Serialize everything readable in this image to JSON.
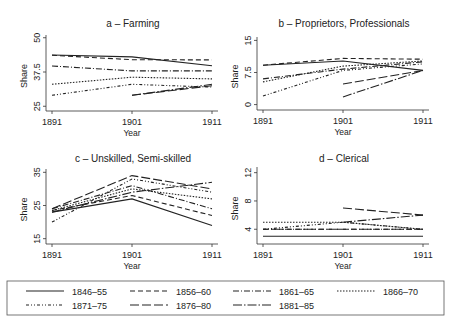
{
  "chart_data": [
    {
      "type": "line",
      "panel": "a",
      "title": "a – Farming",
      "xlabel": "Year",
      "ylabel": "Share",
      "x": [
        1891,
        1901,
        1911
      ],
      "xticks": [
        "1891",
        "1901",
        "1911"
      ],
      "yticks": [
        25,
        37.5,
        50
      ],
      "ytick_labels": [
        "25",
        "37.5",
        "50"
      ],
      "ylim": [
        24,
        51
      ],
      "grid": false,
      "series": [
        {
          "name": "1846–55",
          "values": [
            43.7,
            43.0,
            39.8
          ]
        },
        {
          "name": "1856–60",
          "values": [
            43.6,
            42.0,
            41.9
          ]
        },
        {
          "name": "1861–65",
          "values": [
            39.7,
            37.9,
            37.9
          ]
        },
        {
          "name": "1866–70",
          "values": [
            33.0,
            35.6,
            35.0
          ]
        },
        {
          "name": "1871–75",
          "values": [
            29.0,
            33.0,
            32.0
          ]
        },
        {
          "name": "1876–80",
          "values": [
            null,
            29.0,
            32.5
          ]
        },
        {
          "name": "1881–85",
          "values": [
            null,
            29.0,
            33.0
          ]
        }
      ]
    },
    {
      "type": "line",
      "panel": "b",
      "title": "b – Proprietors, Professionals",
      "xlabel": "Year",
      "ylabel": "Share",
      "x": [
        1891,
        1901,
        1911
      ],
      "xticks": [
        "1891",
        "1901",
        "1911"
      ],
      "yticks": [
        0,
        7.5,
        15
      ],
      "ytick_labels": [
        "0",
        "7.5",
        "15"
      ],
      "ylim": [
        -0.8,
        15.8
      ],
      "grid": false,
      "series": [
        {
          "name": "1846–55",
          "values": [
            9.2,
            10.2,
            8.0
          ]
        },
        {
          "name": "1856–60",
          "values": [
            9.2,
            10.8,
            10.6
          ]
        },
        {
          "name": "1861–65",
          "values": [
            6.0,
            8.3,
            10.0
          ]
        },
        {
          "name": "1866–70",
          "values": [
            5.3,
            9.0,
            10.2
          ]
        },
        {
          "name": "1871–75",
          "values": [
            2.0,
            8.0,
            9.5
          ]
        },
        {
          "name": "1876–80",
          "values": [
            null,
            4.8,
            8.0
          ]
        },
        {
          "name": "1881–85",
          "values": [
            null,
            1.8,
            8.0
          ]
        }
      ]
    },
    {
      "type": "line",
      "panel": "c",
      "title": "c – Unskilled, Semi-skilled",
      "xlabel": "Year",
      "ylabel": "Share",
      "x": [
        1891,
        1901,
        1911
      ],
      "xticks": [
        "1891",
        "1901",
        "1911"
      ],
      "yticks": [
        15,
        25,
        35
      ],
      "ytick_labels": [
        "15",
        "25",
        "35"
      ],
      "ylim": [
        14,
        36
      ],
      "grid": false,
      "series": [
        {
          "name": "1846–55",
          "values": [
            23.0,
            27.0,
            19.0
          ]
        },
        {
          "name": "1856–60",
          "values": [
            23.5,
            28.0,
            22.0
          ]
        },
        {
          "name": "1861–65",
          "values": [
            24.0,
            31.0,
            24.0
          ]
        },
        {
          "name": "1866–70",
          "values": [
            23.5,
            30.0,
            27.0
          ]
        },
        {
          "name": "1871–75",
          "values": [
            20.0,
            33.0,
            29.0
          ]
        },
        {
          "name": "1876–80",
          "values": [
            24.0,
            34.0,
            30.0
          ]
        },
        {
          "name": "1881–85",
          "values": [
            23.0,
            29.0,
            32.0
          ]
        }
      ]
    },
    {
      "type": "line",
      "panel": "d",
      "title": "d – Clerical",
      "xlabel": "Year",
      "ylabel": "Share",
      "x": [
        1891,
        1901,
        1911
      ],
      "xticks": [
        "1891",
        "1901",
        "1911"
      ],
      "yticks": [
        4,
        8,
        12
      ],
      "ytick_labels": [
        "4",
        "8",
        "12"
      ],
      "ylim": [
        2.2,
        12.8
      ],
      "grid": false,
      "series": [
        {
          "name": "1846–55",
          "values": [
            3.0,
            3.0,
            3.0
          ]
        },
        {
          "name": "1856–60",
          "values": [
            4.0,
            4.0,
            4.0
          ]
        },
        {
          "name": "1861–65",
          "values": [
            4.0,
            4.0,
            4.0
          ]
        },
        {
          "name": "1866–70",
          "values": [
            5.0,
            5.0,
            4.0
          ]
        },
        {
          "name": "1871–75",
          "values": [
            4.0,
            5.0,
            4.0
          ]
        },
        {
          "name": "1876–80",
          "values": [
            null,
            7.0,
            6.0
          ]
        },
        {
          "name": "1881–85",
          "values": [
            null,
            5.0,
            6.0
          ]
        }
      ]
    }
  ],
  "legend": {
    "position": "bottom",
    "entries": [
      {
        "label": "1846–55",
        "style": "solid"
      },
      {
        "label": "1856–60",
        "style": "dashed"
      },
      {
        "label": "1861–65",
        "style": "dash-dot"
      },
      {
        "label": "1866–70",
        "style": "dotted"
      },
      {
        "label": "1871–75",
        "style": "dash-dot-dot"
      },
      {
        "label": "1876–80",
        "style": "long-dash"
      },
      {
        "label": "1881–85",
        "style": "long-dash-dot"
      }
    ]
  },
  "colors": {
    "line": "#222222",
    "axis": "#333333",
    "legend_border": "#555555"
  }
}
